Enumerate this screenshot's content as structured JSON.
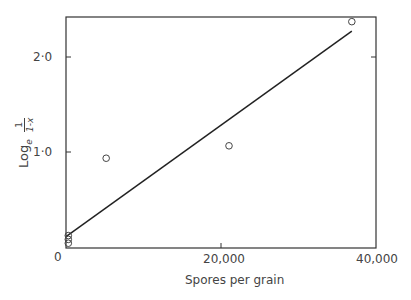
{
  "chart_data": {
    "type": "scatter",
    "title": "",
    "xlabel": "Spores per grain",
    "ylabel": "Log_e 1/(1-x)",
    "ylabel_parts": {
      "log": "Log",
      "sub": "e",
      "num": "1",
      "den": "1-x"
    },
    "xlim": [
      0,
      40000
    ],
    "ylim": [
      0,
      2.4
    ],
    "x_ticks": [
      "0",
      "20,000",
      "40,000"
    ],
    "y_ticks": [
      "0",
      "1·0",
      "2·0"
    ],
    "grid": false,
    "series": [
      {
        "name": "observations",
        "marker": "open-circle",
        "points": [
          {
            "x": 300,
            "y": 0.05
          },
          {
            "x": 300,
            "y": 0.09
          },
          {
            "x": 300,
            "y": 0.13
          },
          {
            "x": 5200,
            "y": 0.94
          },
          {
            "x": 21100,
            "y": 1.07
          },
          {
            "x": 37000,
            "y": 2.37
          }
        ]
      },
      {
        "name": "fitted line",
        "type": "line",
        "points": [
          {
            "x": 0,
            "y": 0.12
          },
          {
            "x": 37000,
            "y": 2.27
          }
        ]
      }
    ]
  }
}
